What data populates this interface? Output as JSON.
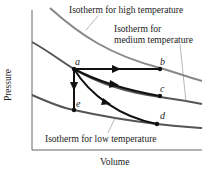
{
  "diagram": {
    "type": "pV-diagram",
    "x_axis_label": "Volume",
    "y_axis_label": "Pressure",
    "isotherm_labels": {
      "high": "Isotherm for high temperature",
      "medium_line1": "Isotherm for",
      "medium_line2": "medium temperature",
      "low": "Isotherm for low temperature"
    },
    "points": {
      "a": "a",
      "b": "b",
      "c": "c",
      "d": "d",
      "e": "e"
    },
    "colors": {
      "isotherm": "#777777",
      "process": "#111111",
      "axis": "#555555"
    }
  }
}
